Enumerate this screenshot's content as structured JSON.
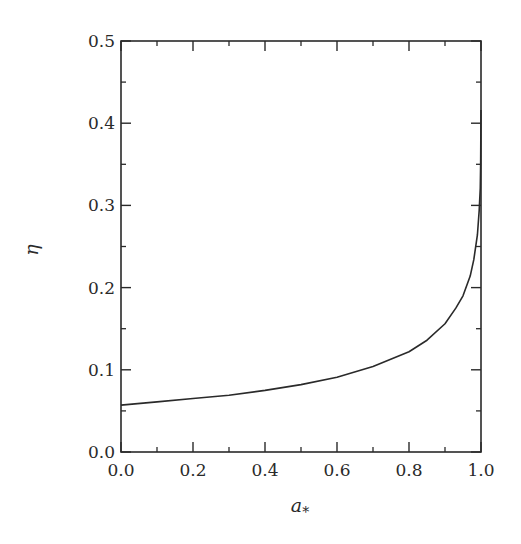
{
  "chart_data": {
    "type": "line",
    "title": "",
    "xlabel": "a_*",
    "xlabel_main": "a",
    "xlabel_sub": "*",
    "ylabel": "η",
    "xlim": [
      0.0,
      1.0
    ],
    "ylim": [
      0.0,
      0.5
    ],
    "grid": false,
    "legend": null,
    "x_ticks": [
      0.0,
      0.2,
      0.4,
      0.6,
      0.8,
      1.0
    ],
    "x_tick_labels": [
      "0.0",
      "0.2",
      "0.4",
      "0.6",
      "0.8",
      "1.0"
    ],
    "x_minor_ticks": [
      0.1,
      0.3,
      0.5,
      0.7,
      0.9
    ],
    "y_ticks": [
      0.0,
      0.1,
      0.2,
      0.3,
      0.4,
      0.5
    ],
    "y_tick_labels": [
      "0.0",
      "0.1",
      "0.2",
      "0.3",
      "0.4",
      "0.5"
    ],
    "y_minor_ticks": [
      0.05,
      0.15,
      0.25,
      0.35,
      0.45
    ],
    "series": [
      {
        "name": "η(a_*)",
        "color": "#2a2a2a",
        "x": [
          0.0,
          0.1,
          0.2,
          0.3,
          0.4,
          0.5,
          0.6,
          0.7,
          0.8,
          0.85,
          0.9,
          0.93,
          0.95,
          0.97,
          0.98,
          0.99,
          0.995,
          0.998,
          0.999,
          1.0
        ],
        "y": [
          0.057,
          0.061,
          0.065,
          0.069,
          0.075,
          0.082,
          0.091,
          0.104,
          0.122,
          0.136,
          0.156,
          0.175,
          0.19,
          0.214,
          0.234,
          0.264,
          0.294,
          0.321,
          0.35,
          0.416
        ]
      }
    ]
  }
}
